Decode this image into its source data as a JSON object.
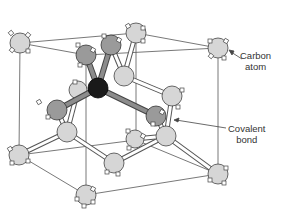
{
  "labels": {
    "carbon_atom": [
      "Carbon",
      "atom"
    ],
    "covalent_bond": [
      "Covalent",
      "bond"
    ]
  },
  "colors": {
    "light_atom": "#d6d6d6",
    "dark_atom": "#9a9a9a",
    "center_atom": "#1a1a1a",
    "line": "#555555",
    "bond_fill": "#ffffff",
    "dark_bond": "#8c8c8c"
  },
  "cube": {
    "corners": {
      "tl": [
        20,
        43
      ],
      "tr": [
        218,
        48
      ],
      "bl": [
        19,
        155
      ],
      "br": [
        218,
        174
      ],
      "tfl": [
        86,
        55
      ],
      "bfl": [
        86,
        195
      ],
      "tbl": [
        136,
        33
      ],
      "bbk": [
        136,
        140
      ]
    }
  },
  "atoms": [
    {
      "id": "a1",
      "x": 20,
      "y": 43,
      "shade": "light",
      "r": 10
    },
    {
      "id": "a2",
      "x": 86,
      "y": 55,
      "shade": "dark",
      "r": 10
    },
    {
      "id": "a3",
      "x": 111,
      "y": 45,
      "shade": "dark",
      "r": 10
    },
    {
      "id": "a4",
      "x": 136,
      "y": 33,
      "shade": "light",
      "r": 10
    },
    {
      "id": "a5",
      "x": 218,
      "y": 48,
      "shade": "light",
      "r": 10
    },
    {
      "id": "a6",
      "x": 124,
      "y": 76,
      "shade": "light",
      "r": 10
    },
    {
      "id": "a7",
      "x": 78,
      "y": 90,
      "shade": "light",
      "r": 9
    },
    {
      "id": "a8",
      "x": 57,
      "y": 110,
      "shade": "dark",
      "r": 10
    },
    {
      "id": "a9",
      "x": 172,
      "y": 96,
      "shade": "light",
      "r": 10
    },
    {
      "id": "a10",
      "x": 156,
      "y": 116,
      "shade": "dark",
      "r": 10
    },
    {
      "id": "a11",
      "x": 67,
      "y": 132,
      "shade": "light",
      "r": 10
    },
    {
      "id": "a12",
      "x": 166,
      "y": 136,
      "shade": "light",
      "r": 10
    },
    {
      "id": "a13",
      "x": 135,
      "y": 139,
      "shade": "light",
      "r": 9
    },
    {
      "id": "a14",
      "x": 19,
      "y": 155,
      "shade": "light",
      "r": 10
    },
    {
      "id": "a15",
      "x": 114,
      "y": 163,
      "shade": "light",
      "r": 10
    },
    {
      "id": "a16",
      "x": 218,
      "y": 174,
      "shade": "light",
      "r": 10
    },
    {
      "id": "a17",
      "x": 86,
      "y": 195,
      "shade": "light",
      "r": 10
    },
    {
      "id": "center",
      "x": 98,
      "y": 88,
      "shade": "center",
      "r": 10
    }
  ]
}
